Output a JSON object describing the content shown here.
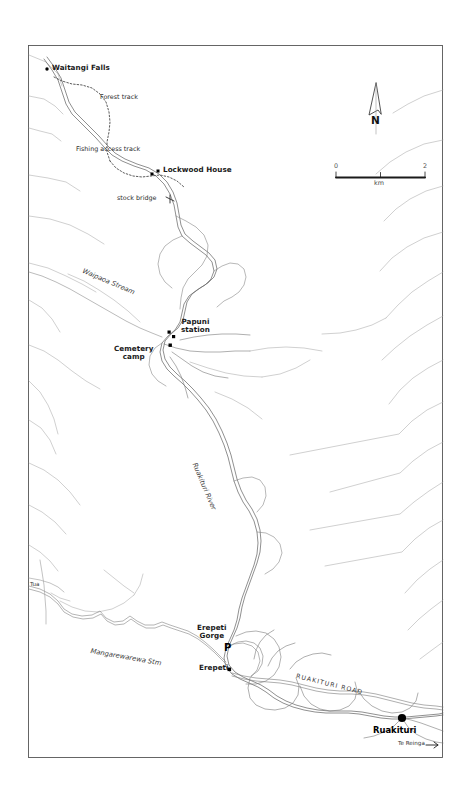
{
  "map": {
    "title": "Ruakituri River area topographic map",
    "background_color": "#ffffff",
    "frame_color": "#555555",
    "river_color": "#6e6e6e",
    "stream_color": "#9a9a9a",
    "road_color": "#777777",
    "track_color": "#4a4a4a",
    "marker_color": "#000000",
    "frame": {
      "x": 28,
      "y": 45,
      "width": 415,
      "height": 713
    }
  },
  "north_arrow": {
    "label": "N",
    "name": "north-arrow"
  },
  "scale_bar": {
    "min_label": "0",
    "max_label": "2",
    "unit_label": "km",
    "length_km": 2
  },
  "labels": {
    "waitangi_falls": "Waitangi Falls",
    "forest_track": "Forest track",
    "fishing_access_track": "Fishing access track",
    "lockwood_house": "Lockwood House",
    "stock_bridge": "stock bridge",
    "waipaoa_stream": "Waipaoa Stream",
    "papuni_station_line1": "Papuni",
    "papuni_station_line2": "station",
    "cemetery_camp_line1": "Cemetery",
    "cemetery_camp_line2": "camp",
    "ruakituri_river": "Ruakituri River",
    "tua": "Tua",
    "mangarewarewa_stm": "Mangarewarewa Stm",
    "erepeti_gorge_line1": "Erepeti",
    "erepeti_gorge_line2": "Gorge",
    "parking": "P",
    "erepeti": "Erepeti",
    "ruakituri_road": "RUAKITURI ROAD",
    "ruakituri": "Ruakituri",
    "te_reinga": "Te Reinga"
  },
  "markers": [
    {
      "name": "waitangi-falls-marker",
      "type": "dot",
      "x": 47,
      "y": 69
    },
    {
      "name": "lockwood-house-marker-1",
      "type": "square",
      "x": 152,
      "y": 174
    },
    {
      "name": "lockwood-house-marker-2",
      "type": "square",
      "x": 158,
      "y": 171
    },
    {
      "name": "papuni-station-marker-1",
      "type": "square",
      "x": 169,
      "y": 332
    },
    {
      "name": "papuni-station-marker-2",
      "type": "square",
      "x": 173,
      "y": 336
    },
    {
      "name": "papuni-station-marker-3",
      "type": "square",
      "x": 170,
      "y": 345
    },
    {
      "name": "erepeti-marker",
      "type": "square",
      "x": 229,
      "y": 669
    },
    {
      "name": "ruakituri-town-marker",
      "type": "big-dot",
      "x": 402,
      "y": 718
    }
  ]
}
